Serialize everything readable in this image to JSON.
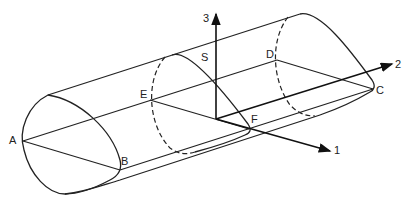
{
  "diagram": {
    "type": "3d-geometry",
    "points": {
      "A": "A",
      "B": "B",
      "C": "C",
      "D": "D",
      "E": "E",
      "F": "F",
      "S": "S"
    },
    "axes": {
      "axis1": "1",
      "axis2": "2",
      "axis3": "3"
    },
    "colors": {
      "line": "#222222",
      "background": "#ffffff"
    }
  }
}
